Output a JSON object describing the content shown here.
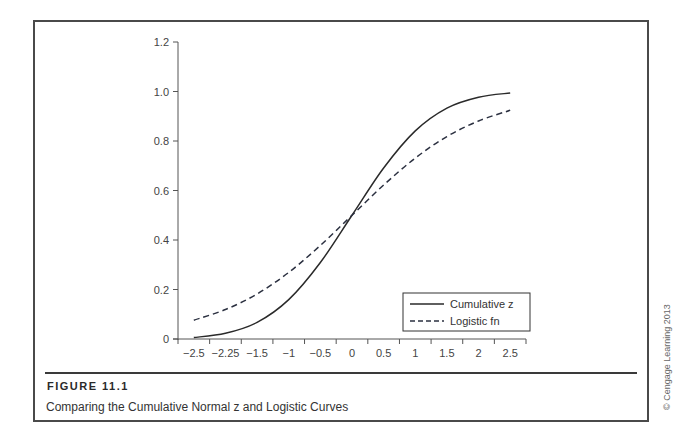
{
  "figure": {
    "label": "FIGURE 11.1",
    "caption": "Comparing the Cumulative Normal z and Logistic Curves",
    "credit": "© Cengage Learning 2013"
  },
  "chart_data": {
    "type": "line",
    "title": "",
    "xlabel": "",
    "ylabel": "",
    "x_tick_labels": [
      "-2.5",
      "-2.25",
      "-1.5",
      "-1",
      "-0.5",
      "0",
      "0.5",
      "1",
      "1.5",
      "2",
      "2.5"
    ],
    "x": [
      -2.5,
      -2,
      -1.5,
      -1,
      -0.5,
      0,
      0.5,
      1,
      1.5,
      2,
      2.5
    ],
    "y_ticks": [
      "0",
      "0.2",
      "0.4",
      "0.6",
      "0.8",
      "1.0",
      "1.2"
    ],
    "ylim": [
      0,
      1.2
    ],
    "grid": false,
    "legend_position": "lower right",
    "series": [
      {
        "name": "Cumulative z",
        "style": "solid",
        "color": "#2a2a2a",
        "values": [
          0.006,
          0.023,
          0.067,
          0.159,
          0.309,
          0.5,
          0.691,
          0.841,
          0.933,
          0.977,
          0.994
        ]
      },
      {
        "name": "Logistic fn",
        "style": "dashed",
        "color": "#2b3040",
        "values": [
          0.076,
          0.119,
          0.182,
          0.269,
          0.378,
          0.5,
          0.622,
          0.731,
          0.818,
          0.881,
          0.924
        ]
      }
    ]
  }
}
